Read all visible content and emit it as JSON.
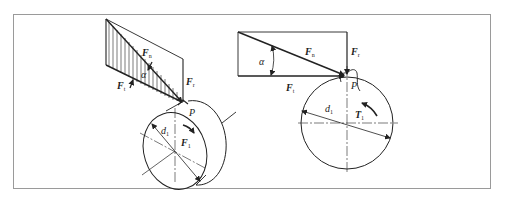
{
  "figure": {
    "frame": {
      "x": 13,
      "y": 14,
      "width": 478,
      "height": 175,
      "stroke": "#9a9a9a"
    },
    "colors": {
      "line": "#222222",
      "frame": "#9a9a9a",
      "background": "#ffffff"
    },
    "left_diagram": {
      "description": "3D view of spur gear force decomposition at pitch point",
      "labels": {
        "Fn": {
          "main": "F",
          "sub": "n"
        },
        "Ft": {
          "main": "F",
          "sub": "t"
        },
        "Fr": {
          "main": "F",
          "sub": "r"
        },
        "alpha": "α",
        "P": "P",
        "d1": {
          "main": "d",
          "sub": "1"
        },
        "T1": {
          "main": "F",
          "sub": "1"
        }
      }
    },
    "right_diagram": {
      "description": "2D front view of spur gear force decomposition",
      "labels": {
        "Fn": {
          "main": "F",
          "sub": "n"
        },
        "Ft": {
          "main": "F",
          "sub": "t"
        },
        "Fr": {
          "main": "F",
          "sub": "r"
        },
        "alpha": "α",
        "P": "P",
        "d1": {
          "main": "d",
          "sub": "1"
        },
        "T1": {
          "main": "T",
          "sub": "1"
        }
      }
    }
  }
}
